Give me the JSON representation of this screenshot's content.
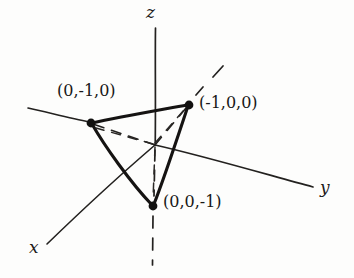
{
  "figure": {
    "kind": "3d-coordinate-axes-diagram",
    "background_color": "#fdfdfc",
    "ink_color": "#1d1b1a",
    "width": 354,
    "height": 278
  },
  "axes": [
    {
      "name": "x-axis",
      "label": "x",
      "label_x": 30,
      "label_y": 238,
      "style": "solid-with-dashed-negative"
    },
    {
      "name": "y-axis",
      "label": "y",
      "label_x": 320,
      "label_y": 178,
      "style": "solid-with-solid-negative"
    },
    {
      "name": "z-axis",
      "label": "z",
      "label_x": 146,
      "label_y": 4,
      "style": "solid-with-dashed-negative"
    }
  ],
  "origin": {
    "x": 155,
    "y": 145
  },
  "vertices": [
    {
      "name": "vertex-0-minus1-0",
      "label": "(0,-1,0)",
      "point_x": 91,
      "point_y": 123,
      "label_x": 57,
      "label_y": 82
    },
    {
      "name": "vertex-minus1-0-0",
      "label": "(-1,0,0)",
      "point_x": 189,
      "point_y": 105,
      "label_x": 200,
      "label_y": 93
    },
    {
      "name": "vertex-0-0-minus1",
      "label": "(0,0,-1)",
      "point_x": 153,
      "point_y": 206,
      "label_x": 163,
      "label_y": 192
    }
  ],
  "triangle": {
    "name": "plane-triangle",
    "edges": [
      "(0,-1,0) to (-1,0,0)",
      "(-1,0,0) to (0,0,-1)",
      "(0,0,-1) to (0,-1,0)"
    ]
  },
  "construction_lines": [
    {
      "name": "dashed-origin-to-vertex-0-minus1-0"
    },
    {
      "name": "dashed-origin-to-vertex-minus1-0-0"
    },
    {
      "name": "dashed-origin-to-vertex-0-0-minus1"
    }
  ]
}
